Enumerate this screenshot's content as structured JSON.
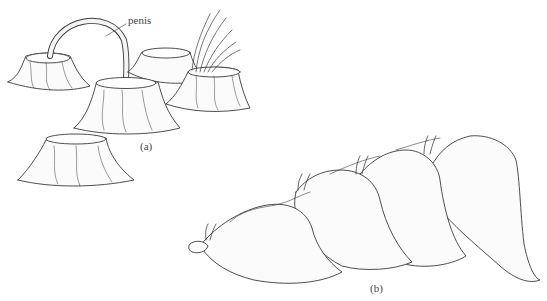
{
  "figure": {
    "panel_a": {
      "label": "(a)",
      "annotation": "penis",
      "description": "barnacles, one extending penis to a neighbor"
    },
    "panel_b": {
      "label": "(b)",
      "description": "chain of sea hares stacked in mating chain"
    }
  },
  "colors": {
    "ink": "#3a3a3a",
    "fill": "#fafafa",
    "background": "#ffffff"
  }
}
